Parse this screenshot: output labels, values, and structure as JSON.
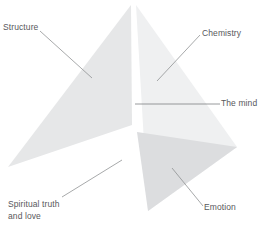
{
  "diagram": {
    "canvas": {
      "width": 261,
      "height": 230,
      "background": "#ffffff"
    },
    "colors": {
      "face_left": "#e6e7e8",
      "face_right": "#eff0f1",
      "face_front": "#dcdddf",
      "leader_line": "#808285",
      "label_text": "#58585b",
      "background": "#ffffff"
    },
    "labels": {
      "structure": "Structure",
      "chemistry": "Chemistry",
      "the_mind": "The mind",
      "emotion": "Emotion",
      "spiritual": "Spiritual truth\nand love"
    },
    "shapes": [
      {
        "name": "left-face",
        "points": "131,5 8,167 132,125",
        "fill": "#e6e7e8"
      },
      {
        "name": "right-face",
        "points": "136,5 237,147 148,211",
        "fill": "#eff0f1"
      },
      {
        "name": "front-face",
        "points": "137,132 237,147 148,211",
        "fill": "#dcdddf"
      }
    ],
    "leaders": [
      {
        "name": "structure-leader",
        "x1": 40,
        "y1": 31,
        "x2": 92,
        "y2": 78
      },
      {
        "name": "chemistry-leader",
        "x1": 200,
        "y1": 35,
        "x2": 157,
        "y2": 81
      },
      {
        "name": "the-mind-leader",
        "x1": 135,
        "y1": 104,
        "x2": 220,
        "y2": 104
      },
      {
        "name": "emotion-leader",
        "x1": 203,
        "y1": 206,
        "x2": 172,
        "y2": 168
      },
      {
        "name": "spiritual-leader",
        "x1": 62,
        "y1": 197,
        "x2": 122,
        "y2": 160
      }
    ]
  }
}
